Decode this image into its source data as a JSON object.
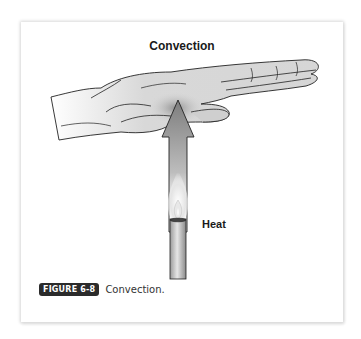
{
  "figure": {
    "title": "Convection",
    "heat_label": "Heat",
    "caption": {
      "badge": "FIGURE 6-8",
      "text": "Convection."
    }
  },
  "colors": {
    "background": "#ffffff",
    "badge_bg": "#2b2b2b",
    "line": "#222222",
    "skin": "#d9d9d9",
    "arrow": "#8a8a8a"
  }
}
